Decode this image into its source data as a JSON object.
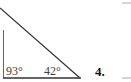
{
  "diagram": {
    "type": "triangle",
    "angles": [
      {
        "label": "93°",
        "position": "bottom-left"
      },
      {
        "label": "42°",
        "position": "bottom-right"
      }
    ],
    "problem_number": "4.",
    "line_color": "#333333"
  }
}
